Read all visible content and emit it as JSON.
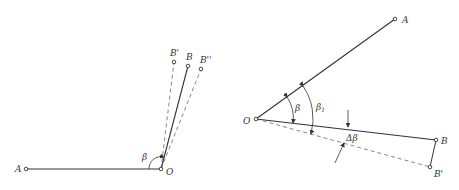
{
  "figure_left": {
    "labels": {
      "A": "A",
      "O": "O",
      "B": "B",
      "B_prime": "B'",
      "B_double_prime": "B''",
      "beta": "β"
    }
  },
  "figure_right": {
    "labels": {
      "A": "A",
      "O": "O",
      "B": "B",
      "B_prime": "B'",
      "beta": "β",
      "beta1": "β",
      "beta1_sub": "1",
      "delta_beta": "Δβ"
    }
  },
  "colors": {
    "line": "#333333",
    "background": "#ffffff"
  }
}
